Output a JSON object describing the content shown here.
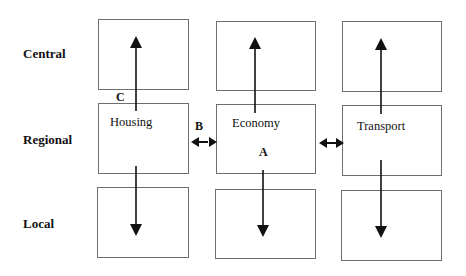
{
  "diagram": {
    "rows": [
      {
        "id": "central",
        "label": "Central"
      },
      {
        "id": "regional",
        "label": "Regional"
      },
      {
        "id": "local",
        "label": "Local"
      }
    ],
    "columns": [
      {
        "id": "housing",
        "label": "Housing"
      },
      {
        "id": "economy",
        "label": "Economy"
      },
      {
        "id": "transport",
        "label": "Transport"
      }
    ],
    "markers": {
      "a": "A",
      "b": "B",
      "c": "C"
    },
    "edges": [
      {
        "from": "housing-regional",
        "to": "housing-central",
        "type": "vertical-up"
      },
      {
        "from": "housing-regional",
        "to": "housing-local",
        "type": "vertical-down"
      },
      {
        "from": "economy-regional",
        "to": "economy-central",
        "type": "vertical-up"
      },
      {
        "from": "economy-regional",
        "to": "economy-local",
        "type": "vertical-down"
      },
      {
        "from": "transport-regional",
        "to": "transport-central",
        "type": "vertical-up"
      },
      {
        "from": "transport-regional",
        "to": "transport-local",
        "type": "vertical-down"
      },
      {
        "from": "housing-regional",
        "to": "economy-regional",
        "type": "bidirectional",
        "marker": "B"
      },
      {
        "from": "economy-regional",
        "to": "transport-regional",
        "type": "bidirectional"
      }
    ],
    "colors": {
      "box_border": "#6e6e6e",
      "arrow": "#111111",
      "text": "#111111"
    }
  }
}
